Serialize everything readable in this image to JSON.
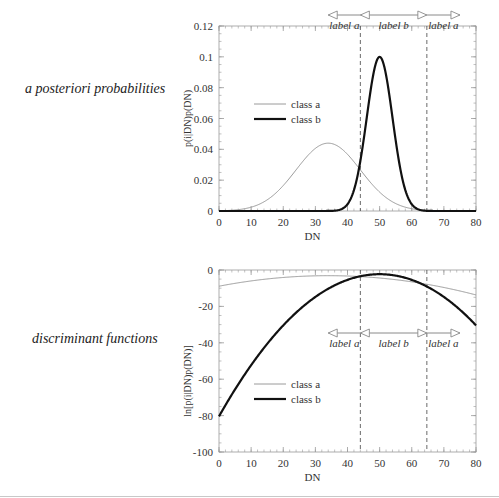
{
  "panels": [
    {
      "side_label": "a posteriori probabilities",
      "ylabel": "p(i|DN)p(DN)",
      "xlabel": "DN"
    },
    {
      "side_label": "discriminant functions",
      "ylabel": "ln[p(i|DN)p(DN)]",
      "xlabel": "DN"
    }
  ],
  "chart_data": [
    {
      "type": "line",
      "title": "a posteriori probabilities",
      "xlabel": "DN",
      "ylabel": "p(i|DN)p(DN)",
      "xlim": [
        0,
        80
      ],
      "ylim": [
        0,
        0.12
      ],
      "xticks": [
        0,
        10,
        20,
        30,
        40,
        50,
        60,
        70,
        80
      ],
      "yticks": [
        0,
        0.02,
        0.04,
        0.06,
        0.08,
        0.1,
        0.12
      ],
      "ytick_labels": [
        "0",
        "0.02",
        "0.04",
        "0.06",
        "0.08",
        "0.1",
        "0.12"
      ],
      "grid": false,
      "legend_position": "upper left (inside)",
      "series": [
        {
          "name": "class a",
          "style": "thin gray",
          "peak_x": 34,
          "peak_y": 0.044,
          "sigma": 10
        },
        {
          "name": "class b",
          "style": "thick black",
          "peak_x": 50,
          "peak_y": 0.1,
          "sigma": 4
        }
      ],
      "decision_boundaries": [
        44,
        64.7
      ],
      "region_labels": [
        {
          "label": "label a",
          "from": 34,
          "to": 44
        },
        {
          "label": "label b",
          "from": 44,
          "to": 64.7
        },
        {
          "label": "label a",
          "from": 64.7,
          "to": 75
        }
      ]
    },
    {
      "type": "line",
      "title": "discriminant functions",
      "xlabel": "DN",
      "ylabel": "ln[p(i|DN)p(DN)]",
      "xlim": [
        0,
        80
      ],
      "ylim": [
        -100,
        0
      ],
      "xticks": [
        0,
        10,
        20,
        30,
        40,
        50,
        60,
        70,
        80
      ],
      "yticks": [
        0,
        -20,
        -40,
        -60,
        -80,
        -100
      ],
      "ytick_labels": [
        "0",
        "-20",
        "-40",
        "-60",
        "-80",
        "-100"
      ],
      "grid": false,
      "legend_position": "lower left (inside)",
      "series": [
        {
          "name": "class a",
          "style": "thin gray",
          "peak_x": 34,
          "peak_y": 0.044,
          "sigma": 10,
          "log": true
        },
        {
          "name": "class b",
          "style": "thick black",
          "peak_x": 50,
          "peak_y": 0.1,
          "sigma": 4,
          "log": true
        }
      ],
      "decision_boundaries": [
        44,
        64.7
      ],
      "region_labels": [
        {
          "label": "label a",
          "from": 34,
          "to": 44
        },
        {
          "label": "label b",
          "from": 44,
          "to": 64.7
        },
        {
          "label": "label a",
          "from": 64.7,
          "to": 75
        }
      ]
    }
  ],
  "layout": {
    "plots": [
      {
        "x0": 219,
        "x1": 476,
        "y0": 26,
        "y1": 211,
        "arrow_y": 15,
        "legend_y": 104
      },
      {
        "x0": 219,
        "x1": 476,
        "y0": 270,
        "y1": 452,
        "arrow_y": 333,
        "legend_y": 384
      }
    ],
    "colors": {
      "class_a": "#9a9a9a",
      "class_b": "#111111",
      "axis": "#999999",
      "arrow": "#8a8a8a"
    }
  }
}
